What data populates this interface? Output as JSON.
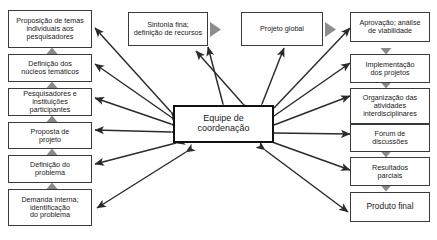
{
  "diagram": {
    "center": {
      "label": "Equipe de\ncoordenação",
      "line1": "Equipe de",
      "line2": "coordenação"
    },
    "top_row": [
      {
        "id": "sintonia-fina",
        "label": "Sintonia fina;\ndefinição de recursos",
        "line1": "Sintonia fina;",
        "line2": "definição de recursos"
      },
      {
        "id": "projeto-global",
        "label": "Projeto global",
        "line1": "Projeto global",
        "line2": ""
      }
    ],
    "left_column": [
      {
        "id": "proposicao-temas",
        "line1": "Proposição de temas",
        "line2": "individuais aos",
        "line3": "pesquisadores"
      },
      {
        "id": "definicao-nucleos",
        "line1": "Definição dos",
        "line2": "núcleos temáticos",
        "line3": ""
      },
      {
        "id": "pesquisadores-instituicoes",
        "line1": "Pesquisadores e",
        "line2": "instituições",
        "line3": "participantes"
      },
      {
        "id": "proposta-projeto",
        "line1": "Proposta de",
        "line2": "projeto",
        "line3": ""
      },
      {
        "id": "definicao-problema",
        "line1": "Definição do",
        "line2": "problema",
        "line3": ""
      },
      {
        "id": "demanda-interna",
        "line1": "Demanda interna;",
        "line2": "identificação",
        "line3": "do problema"
      }
    ],
    "right_column": [
      {
        "id": "aprovacao-viabilidade",
        "line1": "Aprovação; análise",
        "line2": "de viabilidade",
        "line3": ""
      },
      {
        "id": "implementacao-projetos",
        "line1": "Implementação",
        "line2": "dos projetos",
        "line3": ""
      },
      {
        "id": "organizacao-atividades",
        "line1": "Organização das",
        "line2": "atividades",
        "line3": "interdisciplinares"
      },
      {
        "id": "forum-discussoes",
        "line1": "Fórum de",
        "line2": "discussões",
        "line3": ""
      },
      {
        "id": "resultados-parciais",
        "line1": "Resultados",
        "line2": "parciais",
        "line3": ""
      },
      {
        "id": "produto-final",
        "line1": "Produto final",
        "line2": "",
        "line3": ""
      }
    ],
    "colors": {
      "box_border": "#3a3a3a",
      "center_border": "#111111",
      "arrow": "#2b2b2b",
      "connector_triangle": "#7a7a7a",
      "background": "#ffffff",
      "text": "#1a1a1a"
    }
  }
}
